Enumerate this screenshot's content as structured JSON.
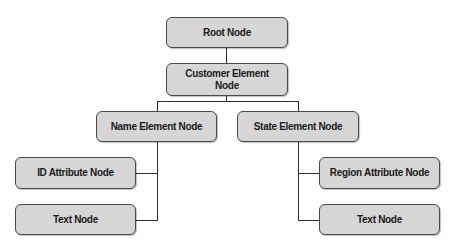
{
  "diagram": {
    "type": "tree",
    "nodes": {
      "root": "Root Node",
      "customer": "Customer Element\nNode",
      "name": "Name Element Node",
      "state": "State Element Node",
      "id_attr": "ID Attribute Node",
      "text_left": "Text Node",
      "region_attr": "Region Attribute Node",
      "text_right": "Text Node"
    },
    "edges": [
      [
        "root",
        "customer"
      ],
      [
        "customer",
        "name"
      ],
      [
        "customer",
        "state"
      ],
      [
        "name",
        "id_attr"
      ],
      [
        "name",
        "text_left"
      ],
      [
        "state",
        "region_attr"
      ],
      [
        "state",
        "text_right"
      ]
    ],
    "colors": {
      "node_fill": "#d6d6d6",
      "node_border": "#4a4a4a",
      "line": "#2e2e2e"
    }
  }
}
